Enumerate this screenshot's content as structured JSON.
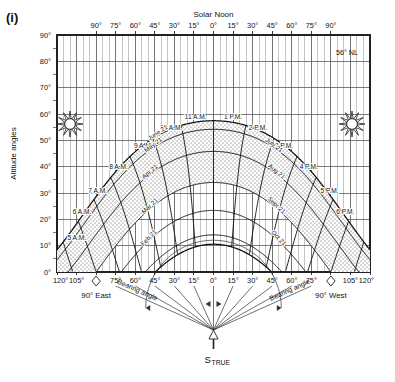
{
  "figure": {
    "label": "(i)",
    "latitude_note": "56° NL",
    "top_center_label": "Solar Noon",
    "y_axis_title": "Altitude angles",
    "bottom_left_label": "90° East",
    "bottom_right_label": "90° West",
    "bearing_label_left": "Bearing angle",
    "bearing_label_right": "Bearing angle",
    "south_marker": "S",
    "south_marker_sub": "TRUE",
    "sun_icon_left": "sun-icon",
    "sun_icon_right": "sun-icon"
  },
  "chart_data": {
    "type": "line",
    "xlabel": "Bearing angle (degrees from true South)",
    "ylabel": "Altitude angles",
    "xlim": [
      -120,
      120
    ],
    "ylim": [
      0,
      90
    ],
    "grid": true,
    "grid_step_x": 5,
    "grid_major_x": 15,
    "grid_step_y": 5,
    "grid_major_y": 10,
    "legend": "none",
    "x_tick_labels_top": [
      "90°",
      "75°",
      "60°",
      "45°",
      "30°",
      "15°",
      "0°",
      "15°",
      "30°",
      "45°",
      "60°",
      "75°",
      "90°"
    ],
    "x_tick_values_top": [
      -90,
      -75,
      -60,
      -45,
      -30,
      -15,
      0,
      15,
      30,
      45,
      60,
      75,
      90
    ],
    "x_tick_labels_bottom": [
      "120°",
      "105°",
      "90°",
      "75°",
      "60°",
      "45°",
      "30°",
      "15°",
      "0°",
      "15°",
      "30°",
      "45°",
      "60°",
      "75°",
      "90°",
      "105°",
      "120°"
    ],
    "x_tick_values_bottom": [
      -120,
      -105,
      -90,
      -75,
      -60,
      -45,
      -30,
      -15,
      0,
      15,
      30,
      45,
      60,
      75,
      90,
      105,
      120
    ],
    "y_tick_labels": [
      "0°",
      "10°",
      "20°",
      "30°",
      "40°",
      "50°",
      "60°",
      "70°",
      "80°",
      "90°"
    ],
    "y_tick_values": [
      0,
      10,
      20,
      30,
      40,
      50,
      60,
      70,
      80,
      90
    ],
    "hour_labels": [
      {
        "label": "5 A.M.",
        "x": -112,
        "y": 12
      },
      {
        "label": "6 A.M.",
        "x": -108,
        "y": 22
      },
      {
        "label": "7 A.M.",
        "x": -96,
        "y": 30
      },
      {
        "label": "8 A.M.",
        "x": -80,
        "y": 39
      },
      {
        "label": "9 A.M.",
        "x": -61,
        "y": 47
      },
      {
        "label": "10 A.M.",
        "x": -41,
        "y": 54
      },
      {
        "label": "11 A.M.",
        "x": -22,
        "y": 58
      },
      {
        "label": "1 P.M.",
        "x": 22,
        "y": 58
      },
      {
        "label": "2 P.M.",
        "x": 41,
        "y": 54
      },
      {
        "label": "3 P.M.",
        "x": 61,
        "y": 47
      },
      {
        "label": "4 P.M.",
        "x": 80,
        "y": 39
      },
      {
        "label": "5 P.M.",
        "x": 96,
        "y": 30
      },
      {
        "label": "6 P.M.",
        "x": 108,
        "y": 22
      }
    ],
    "date_curves": [
      {
        "name": "June 21",
        "declination": 23.45,
        "label_left": "June 21",
        "label_right": "June 21"
      },
      {
        "name": "May 21",
        "declination": 20.2,
        "label_left": "May 21",
        "label_right": "July 21"
      },
      {
        "name": "Apr 21",
        "declination": 11.8,
        "label_left": "Apr 21",
        "label_right": "Aug 21"
      },
      {
        "name": "Mar 21",
        "declination": 0.0,
        "label_left": "Mar 21",
        "label_right": "Sept 21"
      },
      {
        "name": "Feb 21",
        "declination": -10.6,
        "label_left": "Feb 21",
        "label_right": "Oct 21"
      },
      {
        "name": "Jan 21",
        "declination": -19.9,
        "label_left": "Jan 21",
        "label_right": "Nov 21"
      },
      {
        "name": "Dec 21",
        "declination": -23.45,
        "label_left": "Dec 21",
        "label_right": "Dec 21"
      }
    ],
    "shaded_region": "stippled area between sun path curves on morning and afternoon flanks"
  },
  "colors": {
    "background": "#ffffff",
    "grid_minor": "#8c8c8c",
    "grid_major": "#5a5a5a",
    "curve": "#111111",
    "text": "#111111",
    "stipple": "#555555"
  }
}
